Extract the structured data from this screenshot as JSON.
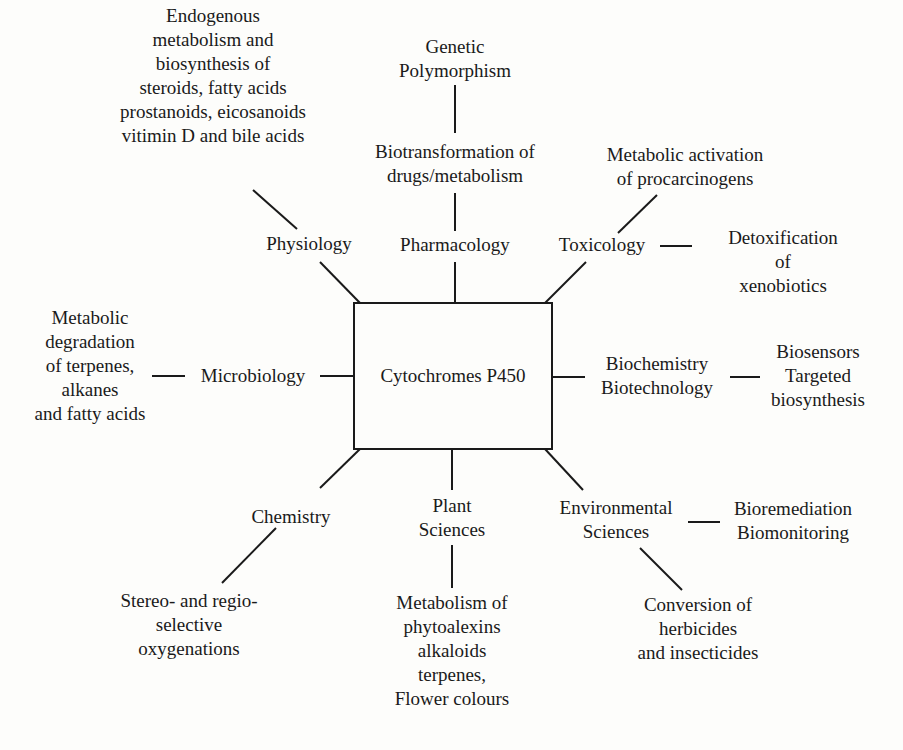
{
  "diagram": {
    "center": {
      "label": "Cytochromes P450"
    },
    "branches": {
      "physiology": {
        "label": "Physiology",
        "detail": "Endogenous\nmetabolism and\nbiosynthesis of\nsteroids, fatty acids\nprostanoids, eicosanoids\nvitimin D and bile acids"
      },
      "pharmacology": {
        "label": "Pharmacology",
        "detail": "Biotransformation of\ndrugs/metabolism",
        "sub_detail": "Genetic\nPolymorphism"
      },
      "toxicology": {
        "label": "Toxicology",
        "detail_upper": "Metabolic activation\nof procarcinogens",
        "detail_right": "Detoxification of\nxenobiotics"
      },
      "microbiology": {
        "label": "Microbiology",
        "detail": "Metabolic\ndegradation\nof terpenes,\nalkanes\nand fatty acids"
      },
      "biochemistry": {
        "label": "Biochemistry\nBiotechnology",
        "detail": "Biosensors\nTargeted\nbiosynthesis"
      },
      "chemistry": {
        "label": "Chemistry",
        "detail": "Stereo- and regio-\nselective\noxygenations"
      },
      "plant_sciences": {
        "label": "Plant\nSciences",
        "detail": "Metabolism of\nphytoalexins\nalkaloids\nterpenes,\nFlower colours"
      },
      "environmental_sciences": {
        "label": "Environmental\nSciences",
        "detail_right": "Bioremediation\nBiomonitoring",
        "detail_lower": "Conversion of\nherbicides\nand insecticides"
      }
    }
  }
}
